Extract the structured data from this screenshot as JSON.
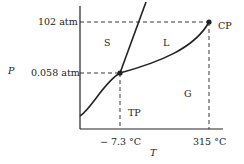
{
  "diagram": {
    "type": "phase-diagram",
    "axes": {
      "y_label": "P",
      "x_label": "T"
    },
    "y_ticks": [
      {
        "label": "102 atm"
      },
      {
        "label": "0.058 atm"
      }
    ],
    "x_ticks": [
      {
        "label": "− 7.3 °C"
      },
      {
        "label": "315 °C"
      }
    ],
    "regions": {
      "solid": "S",
      "liquid": "L",
      "gas": "G"
    },
    "points": {
      "triple": "TP",
      "critical": "CP"
    },
    "colors": {
      "line": "#222222"
    }
  }
}
